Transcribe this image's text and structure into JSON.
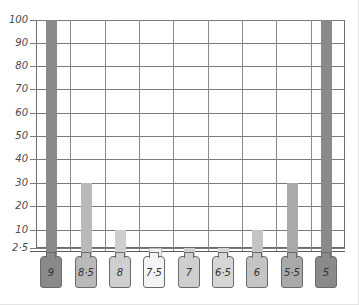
{
  "chart_data": {
    "type": "bar",
    "title": "",
    "xlabel": "",
    "ylabel": "",
    "ylim": [
      2.5,
      100
    ],
    "yticks": [
      "100",
      "90",
      "80",
      "70",
      "60",
      "50",
      "40",
      "30",
      "20",
      "10",
      "2.5"
    ],
    "categories": [
      "9",
      "8.5",
      "8",
      "7.5",
      "7",
      "6.5",
      "6",
      "5.5",
      "5"
    ],
    "values": [
      100,
      30,
      10,
      2.5,
      2.5,
      2.5,
      10,
      30,
      100
    ],
    "grid": true,
    "colors": [
      "#8a8a8a",
      "#b9b9b9",
      "#cfcfcf",
      "#f4f4f4",
      "#cfcfcf",
      "#d6d6d6",
      "#c4c4c4",
      "#a9a9a9",
      "#8a8a8a"
    ]
  },
  "labels": {
    "y": [
      "100",
      "90",
      "80",
      "70",
      "60",
      "50",
      "40",
      "30",
      "20",
      "10",
      "2·5"
    ],
    "x": [
      "9",
      "8·5",
      "8",
      "7·5",
      "7",
      "6·5",
      "6",
      "5·5",
      "5"
    ]
  }
}
